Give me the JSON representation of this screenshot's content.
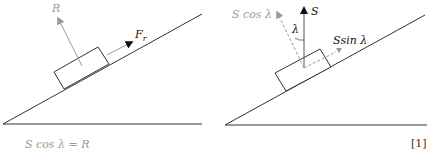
{
  "left_diagram": {
    "R_label": "R",
    "Fr_label": "F",
    "Fr_sub": "r",
    "equation": "S cos λ = R"
  },
  "right_diagram": {
    "S_label": "S",
    "Scos_label": "S cos λ",
    "lambda_label": "λ",
    "Ssin_label": "Ssin λ"
  },
  "mark": "[1]",
  "colors": {
    "line": "#333333",
    "grey": "#9a9a9a",
    "arrow": "#111111"
  }
}
